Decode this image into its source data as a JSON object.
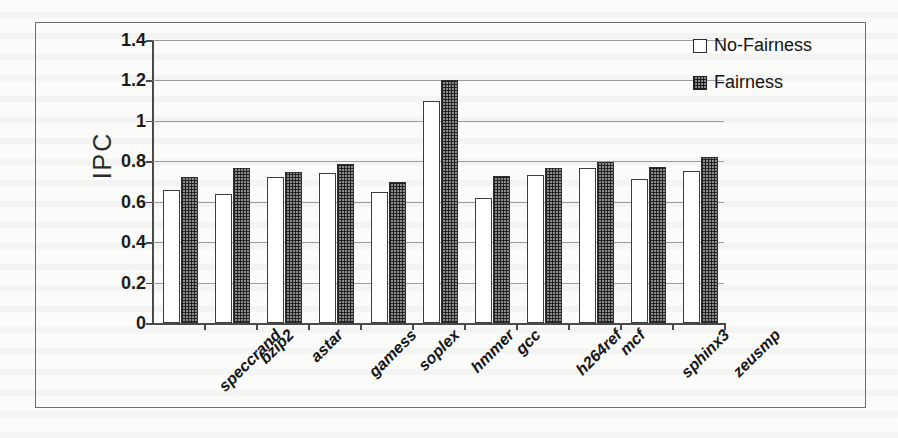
{
  "chart_data": {
    "type": "bar",
    "title": "",
    "xlabel": "",
    "ylabel": "IPC",
    "ylim": [
      0,
      1.4
    ],
    "yticks": [
      "0",
      "0.2",
      "0.4",
      "0.6",
      "0.8",
      "1",
      "1.2",
      "1.4"
    ],
    "ytick_values": [
      0,
      0.2,
      0.4,
      0.6,
      0.8,
      1.0,
      1.2,
      1.4
    ],
    "grid": true,
    "legend_position": "top-right",
    "categories": [
      "speccrand",
      "bzip2",
      "astar",
      "gamess",
      "soplex",
      "hmmer",
      "gcc",
      "h264ref",
      "mcf",
      "sphinx3",
      "zeusmp"
    ],
    "series": [
      {
        "name": "No-Fairness",
        "fill": "white",
        "values": [
          0.66,
          0.64,
          0.72,
          0.74,
          0.65,
          1.1,
          0.62,
          0.73,
          0.765,
          0.71,
          0.75
        ]
      },
      {
        "name": "Fairness",
        "fill": "checkered",
        "values": [
          0.72,
          0.765,
          0.745,
          0.785,
          0.7,
          1.2,
          0.725,
          0.765,
          0.795,
          0.77,
          0.82
        ]
      }
    ]
  },
  "colors": {
    "no_fairness_fill": "#ffffff",
    "no_fairness_stroke": "#3d3d3d",
    "fairness_fill": "#8d8d8d",
    "fairness_stroke": "#2e2e2e",
    "gridline": "#9c9c9c",
    "axis": "#4a4a4a",
    "text": "#141414",
    "frame": "#6f6f6f",
    "background": "#fbfbfa"
  },
  "legend": {
    "items": [
      {
        "label": "No-Fairness",
        "swatch": "empty-square-icon"
      },
      {
        "label": "Fairness",
        "swatch": "checkered-square-icon"
      }
    ]
  }
}
